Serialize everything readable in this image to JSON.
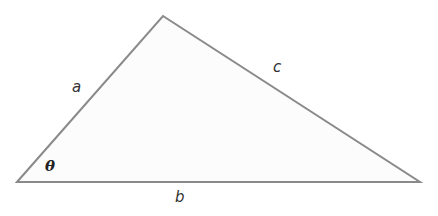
{
  "diagram": {
    "type": "triangle",
    "vertices": {
      "bottom_left": [
        17,
        182
      ],
      "apex": [
        163,
        16
      ],
      "bottom_right": [
        420,
        182
      ]
    },
    "stroke_color": "#8a8a8a",
    "fill_color": "#fcfcfc",
    "labels": {
      "side_a": "a",
      "side_b": "b",
      "side_c": "c",
      "angle": "θ"
    }
  }
}
